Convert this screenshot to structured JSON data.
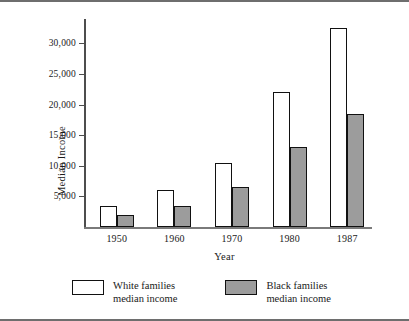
{
  "chart_data": {
    "type": "bar",
    "title": "",
    "xlabel": "Year",
    "ylabel": "Median Income",
    "categories": [
      "1950",
      "1960",
      "1970",
      "1980",
      "1987"
    ],
    "series": [
      {
        "name": "White families median income",
        "color": "#ffffff",
        "values": [
          3500,
          6000,
          10400,
          22000,
          32500
        ]
      },
      {
        "name": "Black families median income",
        "color": "#9c9c9c",
        "values": [
          1900,
          3400,
          6500,
          13000,
          18400
        ]
      }
    ],
    "ylim": [
      0,
      34000
    ],
    "yticks": [
      5000,
      10000,
      15000,
      20000,
      25000,
      30000
    ],
    "ytick_labels": [
      "5,000",
      "10,000",
      "15,000",
      "20,000",
      "25,000",
      "30,000"
    ],
    "grid": false,
    "legend_position": "bottom"
  },
  "legend": {
    "items": [
      {
        "swatch": "white-swatch",
        "line1": "White families",
        "line2": "median income"
      },
      {
        "swatch": "black-swatch",
        "line1": "Black families",
        "line2": "median income"
      }
    ]
  }
}
